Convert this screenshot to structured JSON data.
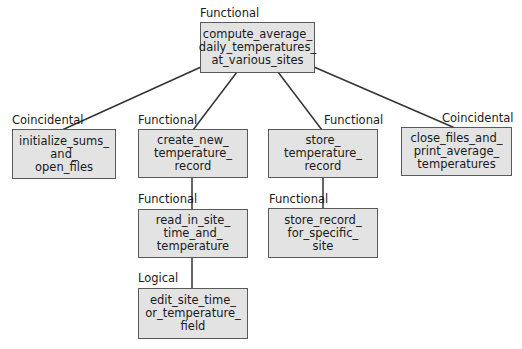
{
  "diagram": {
    "type": "structure-chart",
    "colors": {
      "box_fill": "#e3e3e3",
      "box_border": "#5a5a5a",
      "line": "#333333",
      "text": "#1a1a1a"
    },
    "nodes": [
      {
        "id": "root",
        "label": "compute_average_\ndaily_temperatures_\nat_various_sites",
        "lines": [
          "compute_average_",
          "daily_temperatures_",
          "at_various_sites"
        ],
        "cohesion": "Functional"
      },
      {
        "id": "init",
        "lines": [
          "initialize_sums_",
          "and_",
          "open_files"
        ],
        "cohesion": "Coincidental"
      },
      {
        "id": "create",
        "lines": [
          "create_new_",
          "temperature_",
          "record"
        ],
        "cohesion": "Functional"
      },
      {
        "id": "store",
        "lines": [
          "store_",
          "temperature_",
          "record"
        ],
        "cohesion": "Functional"
      },
      {
        "id": "close",
        "lines": [
          "close_files_and_",
          "print_average_",
          "temperatures"
        ],
        "cohesion": "Coincidental"
      },
      {
        "id": "readin",
        "lines": [
          "read_in_site_",
          "time_and_",
          "temperature"
        ],
        "cohesion": "Functional"
      },
      {
        "id": "storerec",
        "lines": [
          "store_record_",
          "for_specific_",
          "site"
        ],
        "cohesion": "Functional"
      },
      {
        "id": "edit",
        "lines": [
          "edit_site_time_",
          "or_temperature_",
          "field"
        ],
        "cohesion": "Logical"
      }
    ],
    "edges": [
      {
        "from": "root",
        "to": "init"
      },
      {
        "from": "root",
        "to": "create"
      },
      {
        "from": "root",
        "to": "store"
      },
      {
        "from": "root",
        "to": "close"
      },
      {
        "from": "create",
        "to": "readin"
      },
      {
        "from": "readin",
        "to": "edit"
      },
      {
        "from": "store",
        "to": "storerec"
      }
    ]
  }
}
